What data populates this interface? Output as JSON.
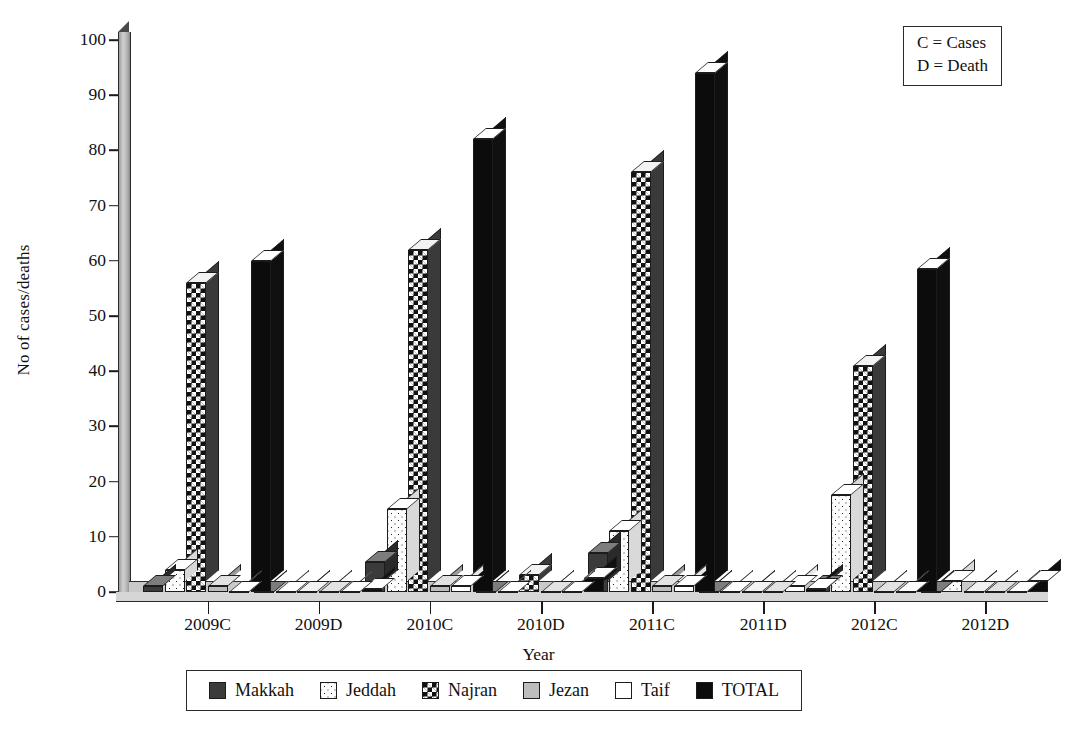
{
  "chart_data": {
    "type": "bar",
    "title": "",
    "xlabel": "Year",
    "ylabel": "No of cases/deaths",
    "ylim": [
      0,
      100
    ],
    "yticks": [
      0,
      10,
      20,
      30,
      40,
      50,
      60,
      70,
      80,
      90,
      100
    ],
    "grid": false,
    "legend_position": "bottom",
    "categories": [
      "2009C",
      "2009D",
      "2010C",
      "2010D",
      "2011C",
      "2011D",
      "2012C",
      "2012D"
    ],
    "series": [
      {
        "name": "Makkah",
        "swatch": "dark-gray-solid",
        "color": "#3b3b3b",
        "values": [
          1,
          0,
          5.5,
          0,
          7,
          0,
          1,
          0
        ]
      },
      {
        "name": "Jeddah",
        "swatch": "white-dotted",
        "color": "#fdfdfd",
        "values": [
          4,
          0,
          15,
          0,
          11,
          0,
          17.5,
          2
        ]
      },
      {
        "name": "Najran",
        "swatch": "black-white-checker",
        "color": "#111111",
        "values": [
          56,
          0,
          62,
          3,
          76,
          0,
          41,
          0
        ]
      },
      {
        "name": "Jezan",
        "swatch": "light-gray-solid",
        "color": "#bdbdbd",
        "values": [
          1,
          0,
          1,
          0,
          1,
          0,
          0,
          0
        ]
      },
      {
        "name": "Taif",
        "swatch": "white-solid",
        "color": "#ffffff",
        "values": [
          0,
          0,
          1,
          0,
          1,
          1,
          0,
          0
        ]
      },
      {
        "name": "TOTAL",
        "swatch": "black-solid",
        "color": "#0c0c0c",
        "values": [
          60,
          0.6,
          82,
          2.5,
          94,
          0.6,
          58.5,
          2
        ]
      }
    ],
    "annotation": {
      "line1": "C = Cases",
      "line2": "D = Death"
    }
  },
  "axis": {
    "ylabel": "No of cases/deaths",
    "xlabel": "Year",
    "ytick_labels": [
      "100",
      "90",
      "80",
      "70",
      "60",
      "50",
      "40",
      "30",
      "20",
      "10",
      "0"
    ],
    "xtick_labels": [
      "2009C",
      "2009D",
      "2010C",
      "2010D",
      "2011C",
      "2011D",
      "2012C",
      "2012D"
    ]
  },
  "annotation_box": {
    "line1": "C = Cases",
    "line2": "D = Death"
  },
  "legend": {
    "items": [
      {
        "label": "Makkah"
      },
      {
        "label": "Jeddah"
      },
      {
        "label": "Najran"
      },
      {
        "label": "Jezan"
      },
      {
        "label": "Taif"
      },
      {
        "label": "TOTAL"
      }
    ]
  }
}
